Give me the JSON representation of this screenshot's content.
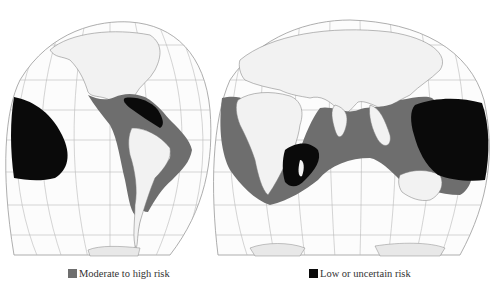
{
  "map": {
    "projection": "interrupted-homolosine",
    "lobes": [
      "americas",
      "eurasia-africa-oceania"
    ],
    "regions": [
      {
        "name": "eastern-pacific",
        "risk": "low"
      },
      {
        "name": "gulf-of-mexico-caribbean",
        "risk": "moderate-high"
      },
      {
        "name": "caribbean-core",
        "risk": "low"
      },
      {
        "name": "pacific-coast-central-south-america",
        "risk": "moderate-high"
      },
      {
        "name": "atlantic-coast-south-america",
        "risk": "moderate-high"
      },
      {
        "name": "west-africa-coast",
        "risk": "moderate-high"
      },
      {
        "name": "indian-ocean",
        "risk": "moderate-high"
      },
      {
        "name": "madagascar-mozambique-channel",
        "risk": "low"
      },
      {
        "name": "western-pacific",
        "risk": "low"
      },
      {
        "name": "australia-surroundings",
        "risk": "moderate-high"
      }
    ]
  },
  "legend": {
    "items": [
      {
        "label": "Moderate to  high risk",
        "color": "#6e6e6e"
      },
      {
        "label": "Low or uncertain risk",
        "color": "#0a0a0a"
      }
    ]
  },
  "colors": {
    "moderate": "#6e6e6e",
    "low": "#0a0a0a",
    "land": "#f4f4f4",
    "grid": "#b8b8b8",
    "outline": "#999999"
  }
}
